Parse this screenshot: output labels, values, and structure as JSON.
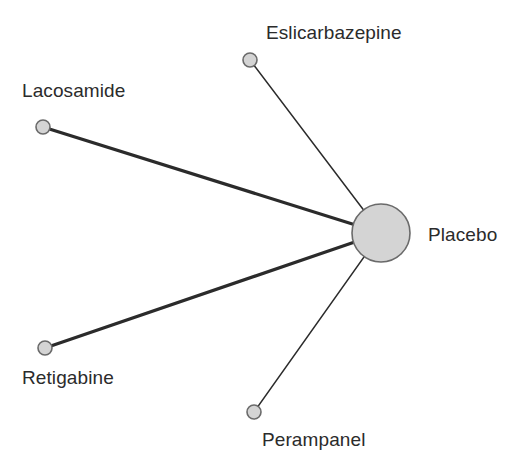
{
  "figure": {
    "type": "network-plot",
    "width": 522,
    "height": 473,
    "background_color": "#ffffff"
  },
  "chart_data": {
    "type": "network",
    "title": "",
    "xlabel": "",
    "ylabel": "",
    "grid": false,
    "legend": "none",
    "node_style": {
      "fill": "#d4d4d4",
      "stroke": "#6a6a6a",
      "stroke_width": 1.6
    },
    "edge_style": {
      "color": "#2b2b2b",
      "thick_width": 3.2,
      "thin_width": 1.5
    },
    "nodes": [
      {
        "id": "placebo",
        "label": "Placebo",
        "cx": 381,
        "cy": 233,
        "r": 29,
        "size_class": "large",
        "label_x": 428,
        "label_y": 224,
        "label_anchor": "left"
      },
      {
        "id": "lacosamide",
        "label": "Lacosamide",
        "cx": 43,
        "cy": 127,
        "r": 7,
        "size_class": "small",
        "label_x": 22,
        "label_y": 80,
        "label_anchor": "left"
      },
      {
        "id": "eslicarbazepine",
        "label": "Eslicarbazepine",
        "cx": 250,
        "cy": 60,
        "r": 7,
        "size_class": "small",
        "label_x": 266,
        "label_y": 22,
        "label_anchor": "left"
      },
      {
        "id": "retigabine",
        "label": "Retigabine",
        "cx": 45,
        "cy": 348,
        "r": 7,
        "size_class": "small",
        "label_x": 22,
        "label_y": 367,
        "label_anchor": "left"
      },
      {
        "id": "perampanel",
        "label": "Perampanel",
        "cx": 254,
        "cy": 412,
        "r": 7,
        "size_class": "small",
        "label_x": 262,
        "label_y": 429,
        "label_anchor": "left"
      }
    ],
    "edges": [
      {
        "id": "edge-lacosamide-placebo",
        "source": "lacosamide",
        "target": "placebo",
        "x1": 43,
        "y1": 127,
        "x2": 381,
        "y2": 233,
        "width": 3.2,
        "weight_class": "thick"
      },
      {
        "id": "edge-eslicarbazepine-placebo",
        "source": "eslicarbazepine",
        "target": "placebo",
        "x1": 250,
        "y1": 60,
        "x2": 381,
        "y2": 233,
        "width": 1.5,
        "weight_class": "thin"
      },
      {
        "id": "edge-retigabine-placebo",
        "source": "retigabine",
        "target": "placebo",
        "x1": 45,
        "y1": 348,
        "x2": 381,
        "y2": 233,
        "width": 3.2,
        "weight_class": "thick"
      },
      {
        "id": "edge-perampanel-placebo",
        "source": "perampanel",
        "target": "placebo",
        "x1": 254,
        "y1": 412,
        "x2": 381,
        "y2": 233,
        "width": 1.5,
        "weight_class": "thin"
      }
    ]
  }
}
